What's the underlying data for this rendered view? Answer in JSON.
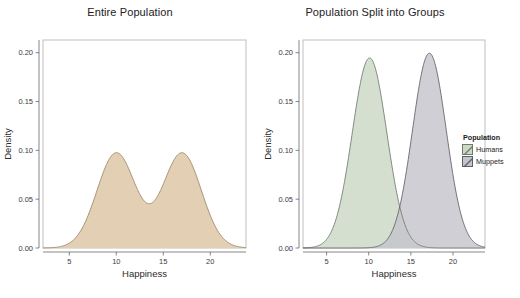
{
  "figure": {
    "background_color": "#ffffff",
    "panel_border_color": "#b9b9b9",
    "axis_color": "#555555",
    "text_color": "#2b2b2b"
  },
  "chart_data": [
    {
      "type": "area",
      "title": "Entire Population",
      "xlabel": "Happiness",
      "ylabel": "Density",
      "xlim": [
        2.2,
        23.8
      ],
      "ylim": [
        0.0,
        0.213
      ],
      "xticks": [
        5,
        10,
        15,
        20
      ],
      "xtick_labels": [
        "5",
        "10",
        "15",
        "20"
      ],
      "yticks": [
        0.0,
        0.05,
        0.1,
        0.15,
        0.2
      ],
      "ytick_labels": [
        "0.00",
        "0.05",
        "0.10",
        "0.15",
        "0.20"
      ],
      "grid": false,
      "legend": "none",
      "series": [
        {
          "name": "Entire Population",
          "fill_color": "#e3cfb4",
          "line_color": "#9b8363",
          "kind": "gaussian-mixture-density",
          "components": [
            {
              "mean": 10.0,
              "sd": 2.05,
              "weight": 0.5
            },
            {
              "mean": 17.0,
              "sd": 2.05,
              "weight": 0.5
            }
          ],
          "peaks": [
            {
              "x": 10.0,
              "y": 0.094
            },
            {
              "x": 17.0,
              "y": 0.094
            }
          ],
          "valley": {
            "x": 13.5,
            "y": 0.045
          }
        }
      ]
    },
    {
      "type": "area",
      "title": "Population Split into Groups",
      "xlabel": "Happiness",
      "ylabel": "Density",
      "xlim": [
        2.2,
        23.8
      ],
      "ylim": [
        0.0,
        0.213
      ],
      "xticks": [
        5,
        10,
        15,
        20
      ],
      "xtick_labels": [
        "5",
        "10",
        "15",
        "20"
      ],
      "yticks": [
        0.0,
        0.05,
        0.1,
        0.15,
        0.2
      ],
      "ytick_labels": [
        "0.00",
        "0.05",
        "0.10",
        "0.15",
        "0.20"
      ],
      "grid": false,
      "legend": "right",
      "series": [
        {
          "name": "Humans",
          "fill_color": "#ccd8c4",
          "line_color": "#6f7a6c",
          "kind": "gaussian-density",
          "mean": 10.1,
          "sd": 2.05,
          "peak": {
            "x": 10.1,
            "y": 0.194
          }
        },
        {
          "name": "Muppets",
          "fill_color": "#c4c4cc",
          "line_color": "#5e5e66",
          "kind": "gaussian-density",
          "mean": 17.2,
          "sd": 2.0,
          "peak": {
            "x": 17.2,
            "y": 0.199
          }
        }
      ],
      "overlap_fill_color": "#8e9191"
    }
  ],
  "legend": {
    "title": "Population",
    "items": [
      {
        "label": "Humans",
        "color": "#ccd8c4",
        "border": "#6f7a6c"
      },
      {
        "label": "Muppets",
        "color": "#c4c4cc",
        "border": "#5e5e66"
      }
    ]
  }
}
